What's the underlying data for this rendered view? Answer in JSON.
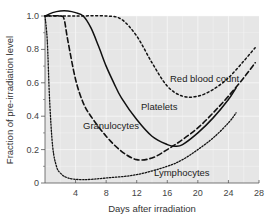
{
  "chart_data": {
    "type": "line",
    "title": "",
    "xlabel": "Days after irradiation",
    "ylabel": "Fraction of pre-irradiation level",
    "xlim": [
      0,
      28
    ],
    "ylim": [
      0,
      1.0
    ],
    "x_ticks": [
      4,
      8,
      12,
      16,
      20,
      24,
      28
    ],
    "y_ticks": [
      0,
      0.2,
      0.4,
      0.6,
      0.8,
      1.0
    ],
    "y_tick_labels": [
      "0",
      "0.2",
      "0.4",
      "0.6",
      "0.8",
      "1.0"
    ],
    "grid": true,
    "legend": "inline labels",
    "series": [
      {
        "name": "Red blood count",
        "style": "dotted",
        "x": [
          0,
          4,
          8,
          10,
          12,
          14,
          16,
          18,
          20,
          22,
          24,
          26,
          27.5
        ],
        "values": [
          1.0,
          1.0,
          1.0,
          0.98,
          0.88,
          0.72,
          0.58,
          0.52,
          0.52,
          0.56,
          0.63,
          0.73,
          0.81
        ]
      },
      {
        "name": "Platelets",
        "style": "solid",
        "x": [
          0,
          1,
          2,
          3,
          4,
          5,
          6,
          7,
          8,
          9,
          10,
          12,
          14,
          16,
          17,
          18,
          20,
          22,
          24,
          25
        ],
        "values": [
          1.0,
          1.02,
          1.03,
          1.03,
          1.02,
          1.0,
          0.93,
          0.82,
          0.7,
          0.6,
          0.51,
          0.38,
          0.28,
          0.23,
          0.22,
          0.23,
          0.3,
          0.39,
          0.5,
          0.57
        ]
      },
      {
        "name": "Granulocytes",
        "style": "dashed",
        "x": [
          0,
          2,
          2.5,
          3,
          4,
          5,
          6,
          8,
          10,
          12,
          14,
          16,
          18,
          20,
          22,
          24,
          26,
          27.5
        ],
        "values": [
          1.0,
          1.0,
          0.98,
          0.85,
          0.62,
          0.48,
          0.4,
          0.28,
          0.19,
          0.14,
          0.15,
          0.2,
          0.26,
          0.33,
          0.42,
          0.52,
          0.63,
          0.72
        ]
      },
      {
        "name": "Lymphocytes",
        "style": "fine-dotted",
        "x": [
          0,
          0.3,
          0.6,
          1,
          1.5,
          2,
          3,
          5,
          8,
          12,
          16,
          18,
          20,
          22,
          24,
          25
        ],
        "values": [
          1.0,
          0.85,
          0.5,
          0.22,
          0.1,
          0.06,
          0.03,
          0.02,
          0.03,
          0.05,
          0.1,
          0.14,
          0.2,
          0.27,
          0.36,
          0.42
        ]
      }
    ],
    "annotations": [
      {
        "text": "Red blood count",
        "x": 16.5,
        "y": 0.6
      },
      {
        "text": "Platelets",
        "x": 12.5,
        "y": 0.44
      },
      {
        "text": "Granulocytes",
        "x": 5,
        "y": 0.33
      },
      {
        "text": "Lymphocytes",
        "x": 14.5,
        "y": 0.05
      }
    ]
  },
  "labels": {
    "xlabel": "Days after irradiation",
    "ylabel": "Fraction of pre-irradiation level",
    "red_blood_count": "Red blood count",
    "platelets": "Platelets",
    "granulocytes": "Granulocytes",
    "lymphocytes": "Lymphocytes"
  },
  "colors": {
    "plot_background": "#e6e6e6",
    "grid": "#f7f7f7",
    "lines": "#111111"
  }
}
